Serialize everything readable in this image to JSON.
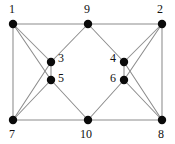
{
  "figure": {
    "name": "undirected-graph-diagram",
    "background_color": "#ffffff",
    "edge_color": "#8c8c8c",
    "node_color": "#0a0a0a",
    "label_color": "#111111",
    "width": 175,
    "height": 144
  },
  "chart_data": {
    "type": "diagram",
    "subtype": "node-link-graph",
    "title": "",
    "directed": false,
    "node_count": 10,
    "edge_count": 20,
    "nodes": [
      {
        "id": "1",
        "label": "1",
        "x": 13,
        "y": 24,
        "r": 4.2,
        "label_x": 9,
        "label_y": 3,
        "label_pos": "above-left"
      },
      {
        "id": "9",
        "label": "9",
        "x": 88,
        "y": 24,
        "r": 4.2,
        "label_x": 84,
        "label_y": 3,
        "label_pos": "above"
      },
      {
        "id": "2",
        "label": "2",
        "x": 162,
        "y": 24,
        "r": 4.2,
        "label_x": 157,
        "label_y": 3,
        "label_pos": "above-left"
      },
      {
        "id": "3",
        "label": "3",
        "x": 51,
        "y": 62,
        "r": 4.2,
        "label_x": 58,
        "label_y": 52,
        "label_pos": "right"
      },
      {
        "id": "4",
        "label": "4",
        "x": 124,
        "y": 62,
        "r": 4.2,
        "label_x": 110,
        "label_y": 52,
        "label_pos": "left"
      },
      {
        "id": "5",
        "label": "5",
        "x": 51,
        "y": 80,
        "r": 4.2,
        "label_x": 58,
        "label_y": 72,
        "label_pos": "right"
      },
      {
        "id": "6",
        "label": "6",
        "x": 124,
        "y": 80,
        "r": 4.2,
        "label_x": 110,
        "label_y": 72,
        "label_pos": "left"
      },
      {
        "id": "7",
        "label": "7",
        "x": 13,
        "y": 120,
        "r": 4.2,
        "label_x": 9,
        "label_y": 128,
        "label_pos": "below"
      },
      {
        "id": "10",
        "label": "10",
        "x": 88,
        "y": 120,
        "r": 4.2,
        "label_x": 80,
        "label_y": 128,
        "label_pos": "below"
      },
      {
        "id": "8",
        "label": "8",
        "x": 162,
        "y": 120,
        "r": 4.2,
        "label_x": 158,
        "label_y": 128,
        "label_pos": "below"
      }
    ],
    "edges": [
      {
        "source": "1",
        "target": "9"
      },
      {
        "source": "9",
        "target": "2"
      },
      {
        "source": "7",
        "target": "10"
      },
      {
        "source": "10",
        "target": "8"
      },
      {
        "source": "1",
        "target": "7"
      },
      {
        "source": "2",
        "target": "8"
      },
      {
        "source": "1",
        "target": "3"
      },
      {
        "source": "1",
        "target": "5"
      },
      {
        "source": "7",
        "target": "3"
      },
      {
        "source": "7",
        "target": "5"
      },
      {
        "source": "2",
        "target": "4"
      },
      {
        "source": "2",
        "target": "6"
      },
      {
        "source": "8",
        "target": "4"
      },
      {
        "source": "8",
        "target": "6"
      },
      {
        "source": "9",
        "target": "3"
      },
      {
        "source": "9",
        "target": "4"
      },
      {
        "source": "10",
        "target": "5"
      },
      {
        "source": "10",
        "target": "6"
      },
      {
        "source": "3",
        "target": "5"
      },
      {
        "source": "4",
        "target": "6"
      }
    ]
  }
}
